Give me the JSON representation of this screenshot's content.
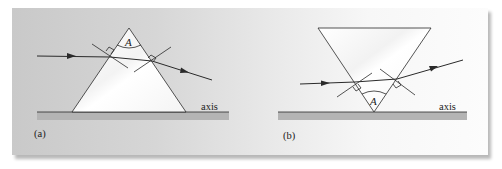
{
  "figure": {
    "panels": [
      {
        "id": "a",
        "caption": "(a)",
        "apex_label": "A",
        "axis_label": "axis",
        "prism_orientation": "apex-up"
      },
      {
        "id": "b",
        "caption": "(b)",
        "apex_label": "A",
        "axis_label": "axis",
        "prism_orientation": "apex-down"
      }
    ]
  },
  "colors": {
    "line": "#2a2a2a",
    "prism_fill": "#f8f8f8",
    "axis_bar": "#b4b4b4",
    "background_left": "#c9c9c9",
    "background_right": "#fcfcfc"
  }
}
